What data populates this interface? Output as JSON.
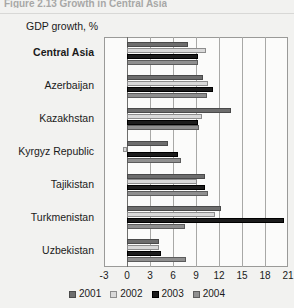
{
  "figure": {
    "title": "Figure 2.13 Growth in Central Asia",
    "axis_title": "GDP growth, %"
  },
  "chart_data": {
    "type": "bar",
    "orientation": "horizontal",
    "title": "GDP growth, %",
    "xlabel": "",
    "ylabel": "",
    "xlim": [
      -3,
      21
    ],
    "xticks": [
      -3,
      0,
      3,
      6,
      9,
      12,
      15,
      18,
      21
    ],
    "grid": true,
    "legend_position": "bottom",
    "categories": [
      "Central Asia",
      "Azerbaijan",
      "Kazakhstan",
      "Kyrgyz Republic",
      "Tajikistan",
      "Turkmenistan",
      "Uzbekistan"
    ],
    "series": [
      {
        "name": "2001",
        "color": "#6d6d6d",
        "values": [
          8.0,
          9.9,
          13.5,
          5.3,
          10.2,
          12.2,
          4.2
        ]
      },
      {
        "name": "2002",
        "color": "#d9d9d9",
        "values": [
          10.3,
          10.6,
          9.8,
          -0.5,
          9.1,
          11.5,
          4.2
        ]
      },
      {
        "name": "2003",
        "color": "#1c1c1c",
        "values": [
          9.3,
          11.2,
          9.3,
          6.7,
          10.2,
          20.5,
          4.4
        ]
      },
      {
        "name": "2004",
        "color": "#8f8f8f",
        "values": [
          9.2,
          10.4,
          9.4,
          7.1,
          10.6,
          7.5,
          7.7
        ]
      }
    ]
  },
  "legend": {
    "items": [
      {
        "label": "2001"
      },
      {
        "label": "2002"
      },
      {
        "label": "2003"
      },
      {
        "label": "2004"
      }
    ]
  }
}
